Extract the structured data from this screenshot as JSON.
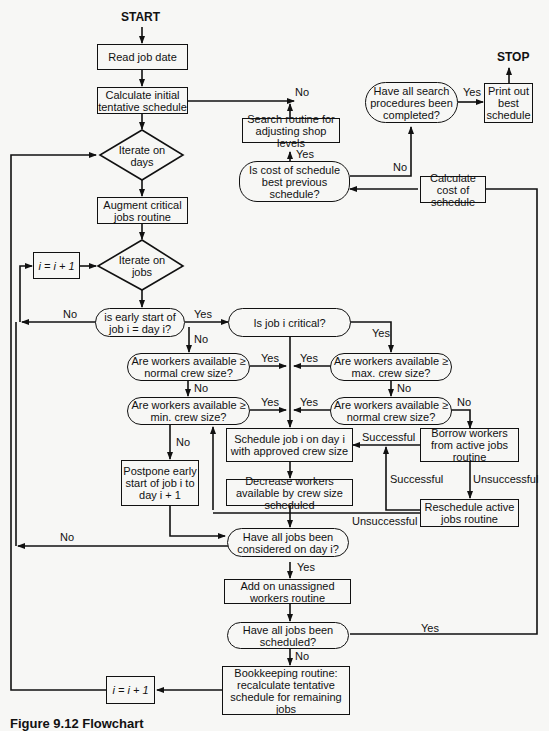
{
  "terminals": {
    "start": "START",
    "stop": "STOP"
  },
  "nodes": {
    "read_job_date": "Read job date",
    "calc_initial": "Calculate initial tentative schedule",
    "iterate_days": "Iterate on days",
    "augment_critical": "Augment critical jobs routine",
    "i_increment_top": "i = i + 1",
    "iterate_jobs": "Iterate on jobs",
    "early_start": "is early start of job i = day i?",
    "is_critical": "Is job i critical?",
    "workers_normal_left": "Are workers available ≥ normal crew size?",
    "workers_min": "Are workers available ≥ min. crew size?",
    "workers_max": "Are workers available ≥ max. crew size?",
    "workers_normal_right": "Are workers available ≥ normal crew size?",
    "schedule_job": "Schedule job i on day i with approved crew size",
    "borrow_workers": "Borrow workers from active jobs routine",
    "postpone": "Postpone early start of job i to day i + 1",
    "decrease_workers": "Decrease workers available by crew size scheduled",
    "reschedule_active": "Reschedule active jobs routine",
    "all_considered": "Have all jobs been considered on day i?",
    "add_unassigned": "Add on unassigned workers routine",
    "all_scheduled": "Have all jobs been scheduled?",
    "bookkeeping": "Bookkeeping routine: recalculate tentative schedule for remaining jobs",
    "i_increment_bottom": "i = i + 1",
    "search_routine": "Search routine for adjusting shop levels",
    "cost_best": "Is cost of schedule best previous schedule?",
    "search_complete": "Have all search procedures been completed?",
    "print_best": "Print out best schedule",
    "calc_cost": "Calculate cost of schedule"
  },
  "edge_labels": {
    "calc_to_search_no": "No",
    "search_complete_yes": "Yes",
    "cost_best_yes": "Yes",
    "cost_best_no": "No",
    "early_start_no": "No",
    "early_start_yes": "Yes",
    "early_start_no_down": "No",
    "critical_yes": "Yes",
    "normal_left_yes": "Yes",
    "max_yes": "Yes",
    "normal_left_no": "No",
    "max_no": "No",
    "min_yes": "Yes",
    "normal_right_yes": "Yes",
    "normal_right_no": "No",
    "min_no": "No",
    "borrow_successful": "Successful",
    "reschedule_successful": "Successful",
    "borrow_unsuccessful": "Unsuccessful",
    "reschedule_unsuccessful": "Unsuccessful",
    "considered_no": "No",
    "considered_yes": "Yes",
    "scheduled_yes": "Yes",
    "scheduled_no": "No"
  },
  "caption": "Figure 9.12 Flowchart"
}
